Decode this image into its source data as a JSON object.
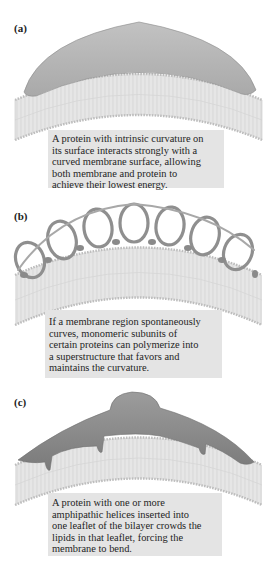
{
  "figure": {
    "panels": [
      {
        "label": "(a)",
        "mechanism": "protein with intrinsic curvature",
        "caption_lines": [
          "A protein with intrinsic curvature on",
          "its surface interacts strongly with a",
          "curved membrane surface, allowing",
          "both membrane and protein to",
          "achieve their lowest energy."
        ]
      },
      {
        "label": "(b)",
        "mechanism": "polymerized protein superstructure",
        "caption_lines": [
          "If a membrane region spontaneously",
          "curves, monomeric subunits of",
          "certain proteins can polymerize into",
          "a superstructure that favors and",
          "maintains the curvature."
        ]
      },
      {
        "label": "(c)",
        "mechanism": "amphipathic helix insertion",
        "caption_lines": [
          "A protein with one or more",
          "amphipathic helices inserted into",
          "one leaflet of the bilayer crowds the",
          "lipids in that leaflet, forcing the",
          "membrane to bend."
        ]
      }
    ],
    "colors": {
      "protein_a": "#b4b4b4",
      "protein_c": "#8a8a8a",
      "coil": "#9a9a9a",
      "membrane_fill": "#f2f2f2",
      "lipid_line": "#b0b0b0",
      "caption_bg": "#e4e4e4"
    }
  }
}
